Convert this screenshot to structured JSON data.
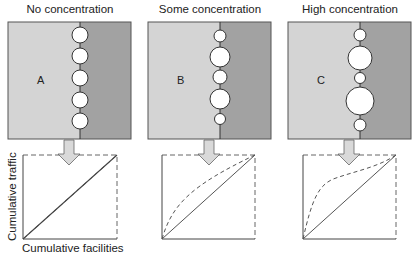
{
  "colors": {
    "left_region": "#d4d4d4",
    "right_region": "#a2a2a2",
    "border": "#555555",
    "circle_fill": "#ffffff",
    "arrow_fill": "#d9d9d9",
    "line": "#555555"
  },
  "panels": [
    {
      "title": "No concentration",
      "letter": "A",
      "circles": [
        {
          "cy": 35,
          "r": 8
        },
        {
          "cy": 56,
          "r": 8
        },
        {
          "cy": 78,
          "r": 8
        },
        {
          "cy": 100,
          "r": 8
        },
        {
          "cy": 121,
          "r": 8
        }
      ],
      "curve": "equal"
    },
    {
      "title": "Some concentration",
      "letter": "B",
      "circles": [
        {
          "cy": 36,
          "r": 6
        },
        {
          "cy": 57,
          "r": 10
        },
        {
          "cy": 77,
          "r": 7
        },
        {
          "cy": 99,
          "r": 10
        },
        {
          "cy": 119,
          "r": 5.5
        }
      ],
      "curve": "moderate"
    },
    {
      "title": "High concentration",
      "letter": "C",
      "circles": [
        {
          "cy": 35,
          "r": 6
        },
        {
          "cy": 58,
          "r": 12
        },
        {
          "cy": 78,
          "r": 5.5
        },
        {
          "cy": 101,
          "r": 14
        },
        {
          "cy": 125,
          "r": 6
        }
      ],
      "curve": "strong"
    }
  ],
  "axes": {
    "ylabel": "Cumulative traffic",
    "xlabel": "Cumulative facilities"
  }
}
